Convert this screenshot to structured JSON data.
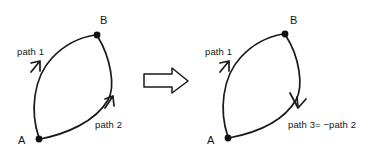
{
  "figure": {
    "background_color": "#ffffff",
    "ink_color": "#1a1a1a",
    "caption": ""
  },
  "left_diagram": {
    "name": "original-path-diagram",
    "nodes": [
      {
        "id": "A",
        "label": "A",
        "x": 39,
        "y": 139
      },
      {
        "id": "B",
        "label": "B",
        "x": 97,
        "y": 35
      }
    ],
    "edges": [
      {
        "id": "path1",
        "label": "path 1",
        "from": "A",
        "to": "B",
        "direction": "A-to-B",
        "arrow_position": "mid-upper-left"
      },
      {
        "id": "path2",
        "label": "path 2",
        "from": "A",
        "to": "B",
        "direction": "A-to-B",
        "arrow_position": "mid-lower-right"
      }
    ]
  },
  "transform_arrow": {
    "name": "implies-arrow",
    "glyph": "rightwards-block-arrow"
  },
  "right_diagram": {
    "name": "reversed-path-diagram",
    "nodes": [
      {
        "id": "A",
        "label": "A",
        "x": 228,
        "y": 138
      },
      {
        "id": "B",
        "label": "B",
        "x": 285,
        "y": 34
      }
    ],
    "edges": [
      {
        "id": "path1",
        "label": "path 1",
        "from": "A",
        "to": "B",
        "direction": "A-to-B",
        "arrow_position": "mid-upper-left"
      },
      {
        "id": "path3",
        "label": "path 3= −path 2",
        "from": "B",
        "to": "A",
        "direction": "B-to-A",
        "arrow_position": "mid-lower-right"
      }
    ]
  }
}
